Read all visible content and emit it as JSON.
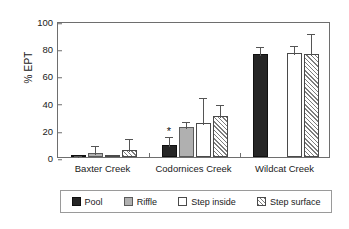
{
  "chart_data": {
    "type": "bar",
    "title": "",
    "xlabel": "",
    "ylabel": "% EPT",
    "ylim": [
      0,
      100
    ],
    "yticks": [
      0,
      20,
      40,
      60,
      80,
      100
    ],
    "grid": false,
    "legend_position": "below-plot",
    "error_bars": "upper only (SD/SE)",
    "categories": [
      "Baxter Creek",
      "Codornices Creek",
      "Wildcat Creek"
    ],
    "series": [
      {
        "name": "Pool",
        "color": "#262626",
        "values": [
          1,
          8.5,
          75.5
        ],
        "errors_upper": [
          2.5,
          16,
          82
        ]
      },
      {
        "name": "Riffle",
        "color": "#b0b0b0",
        "values": [
          3,
          22,
          null
        ],
        "errors_upper": [
          9.5,
          27,
          null
        ]
      },
      {
        "name": "Step inside",
        "color": "#ffffff",
        "values": [
          0.5,
          25,
          76.5
        ],
        "errors_upper": [
          0.5,
          45,
          83
        ]
      },
      {
        "name": "Step surface",
        "color": "#ffffff",
        "pattern": "diagonal-hatch",
        "values": [
          5.5,
          30,
          76
        ],
        "errors_upper": [
          15,
          40,
          92
        ]
      }
    ],
    "annotations": [
      {
        "text": "*",
        "series": "Pool",
        "category": "Codornices Creek",
        "value": 20,
        "meaning": "significant"
      }
    ]
  },
  "axis": {
    "y_title": "% EPT",
    "y_tick_labels": [
      "100",
      "80",
      "60",
      "40",
      "20",
      "0"
    ]
  },
  "legend": {
    "entries": [
      {
        "label": "Pool",
        "swatch": "pool-swatch"
      },
      {
        "label": "Riffle",
        "swatch": "riffle-swatch"
      },
      {
        "label": "Step inside",
        "swatch": "step-inside-swatch"
      },
      {
        "label": "Step surface",
        "swatch": "step-surface-swatch"
      }
    ]
  },
  "x_axis_labels": [
    "Baxter Creek",
    "Codornices Creek",
    "Wildcat Creek"
  ]
}
